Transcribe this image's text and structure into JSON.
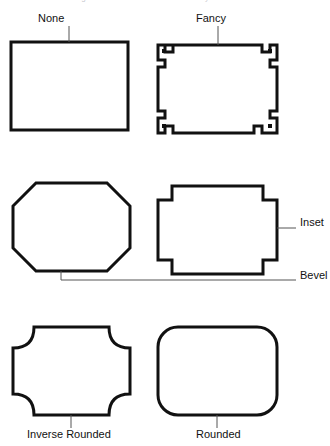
{
  "figure": {
    "caption_remnant": "Figure 5-12: The different border styles available",
    "background_color": "#ffffff",
    "stroke_color": "#111111",
    "leader_color": "#555555",
    "width": 330,
    "height": 446
  },
  "shapes": [
    {
      "id": "none",
      "label": "None",
      "description": "plain rectangle with square corners",
      "label_position": "top",
      "box": {
        "x": 11,
        "y": 42,
        "w": 117,
        "h": 88
      }
    },
    {
      "id": "fancy",
      "label": "Fancy",
      "description": "stepped ornamental corners with small square dots",
      "label_position": "top",
      "box": {
        "x": 158,
        "y": 45,
        "w": 119,
        "h": 88
      }
    },
    {
      "id": "bevel",
      "label": "Bevel",
      "description": "rectangle with diagonally cut (chamfered) corners",
      "label_position": "right",
      "box": {
        "x": 13,
        "y": 183,
        "w": 117,
        "h": 88
      }
    },
    {
      "id": "inset",
      "label": "Inset",
      "description": "rectangle with square notches cut into the corners",
      "label_position": "right",
      "box": {
        "x": 158,
        "y": 186,
        "w": 119,
        "h": 88
      }
    },
    {
      "id": "inverse-rounded",
      "label": "Inverse Rounded",
      "description": "rectangle with concave inward-curving corners",
      "label_position": "bottom",
      "box": {
        "x": 13,
        "y": 327,
        "w": 117,
        "h": 88
      }
    },
    {
      "id": "rounded",
      "label": "Rounded",
      "description": "rectangle with convex rounded corners",
      "label_position": "bottom",
      "box": {
        "x": 158,
        "y": 327,
        "w": 119,
        "h": 88
      }
    }
  ]
}
